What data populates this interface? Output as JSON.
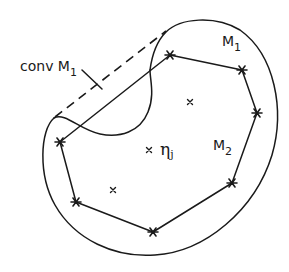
{
  "labels": {
    "conv_m1": "conv M",
    "conv_m1_sub": "1",
    "m1": "M",
    "m1_sub": "1",
    "m2": "M",
    "m2_sub": "2",
    "eta": "η",
    "eta_sub": "j"
  },
  "polygon_vertices": [
    [
      170,
      55
    ],
    [
      242,
      70
    ],
    [
      257,
      113
    ],
    [
      232,
      183
    ],
    [
      153,
      232
    ],
    [
      76,
      202
    ],
    [
      60,
      142
    ]
  ],
  "interior_points": [
    [
      190,
      102
    ],
    [
      149,
      150
    ],
    [
      113,
      190
    ]
  ],
  "colors": {
    "ink": "#1a1a1a",
    "background": "#ffffff"
  }
}
